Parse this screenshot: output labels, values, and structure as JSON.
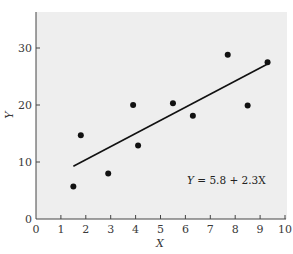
{
  "chart_data": {
    "type": "scatter",
    "title": "",
    "xlabel": "X",
    "ylabel": "Y",
    "xlim": [
      0,
      10
    ],
    "ylim": [
      0,
      36
    ],
    "x_ticks": [
      0,
      1,
      2,
      3,
      4,
      5,
      6,
      7,
      8,
      9,
      10
    ],
    "y_ticks": [
      0,
      10,
      20,
      30
    ],
    "x_tick_labels": [
      "0",
      "1",
      "2",
      "3",
      "4",
      "5",
      "6",
      "7",
      "8",
      "9",
      "10"
    ],
    "y_tick_labels": [
      "0",
      "10",
      "20",
      "30"
    ],
    "grid": false,
    "legend": null,
    "series": [
      {
        "name": "observations",
        "type": "scatter",
        "x": [
          1.5,
          1.8,
          2.9,
          3.9,
          4.1,
          5.5,
          6.3,
          7.7,
          8.5,
          9.3
        ],
        "y": [
          5.7,
          14.7,
          8.0,
          20.0,
          12.9,
          20.3,
          18.1,
          28.8,
          19.9,
          27.5
        ]
      },
      {
        "name": "regression line",
        "type": "line",
        "intercept": 5.8,
        "slope": 2.3,
        "x": [
          1.5,
          9.3
        ],
        "y": [
          9.25,
          27.19
        ]
      }
    ],
    "annotations": [
      {
        "text": "Y = 5.8 + 2.3X",
        "x": 6.4,
        "y": 6.9
      }
    ]
  },
  "labels": {
    "x_axis": "X",
    "y_axis": "Y",
    "equation_y": "Y",
    "equation_mid": " = 5.8 + 2.3",
    "equation_x": "X"
  },
  "colors": {
    "plot_background": "#eeeeee",
    "axis": "#444444",
    "points": "#111111",
    "line": "#111111"
  }
}
